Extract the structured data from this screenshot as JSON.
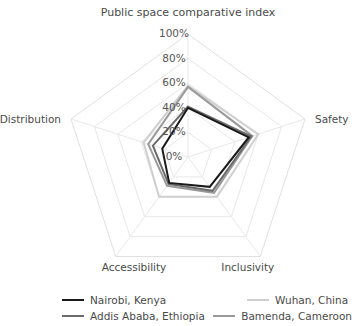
{
  "chart_data": {
    "type": "radar",
    "title": "Public space comparative index",
    "categories": [
      "Public space comparative index",
      "Safety",
      "Inclusivity",
      "Accessibility",
      "Distribution"
    ],
    "axis_labels": {
      "top": "Public space comparative index",
      "right": "Safety",
      "bottom_right": "Inclusivity",
      "bottom_left": "Accessibility",
      "left": "Distribution"
    },
    "tick_labels": [
      "0%",
      "20%",
      "40%",
      "60%",
      "80%",
      "100%"
    ],
    "tick_values": [
      0,
      20,
      40,
      60,
      80,
      100
    ],
    "rlim": [
      0,
      100
    ],
    "grid": true,
    "legend_position": "bottom",
    "series": [
      {
        "name": "Nairobi, Kenya",
        "color": "#1a1a1a",
        "values": [
          40,
          52,
          30,
          26,
          22
        ]
      },
      {
        "name": "Wuhan, China",
        "color": "#cfcfcf",
        "values": [
          58,
          60,
          40,
          40,
          38
        ]
      },
      {
        "name": "Addis Ababa, Ethiopia",
        "color": "#6b6b6b",
        "values": [
          41,
          54,
          34,
          27,
          30
        ]
      },
      {
        "name": "Bamenda, Cameroon",
        "color": "#9a9a9a",
        "values": [
          57,
          55,
          36,
          29,
          34
        ]
      }
    ]
  },
  "legend": {
    "items": [
      {
        "label": "Nairobi, Kenya",
        "color": "#1a1a1a"
      },
      {
        "label": "Wuhan, China",
        "color": "#cfcfcf"
      },
      {
        "label": "Addis Ababa, Ethiopia",
        "color": "#6b6b6b"
      },
      {
        "label": "Bamenda, Cameroon",
        "color": "#9a9a9a"
      }
    ]
  }
}
